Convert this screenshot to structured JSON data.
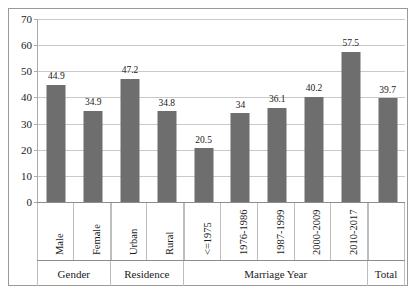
{
  "chart_data": {
    "type": "bar",
    "title": "",
    "subtitle": "",
    "xlabel": "",
    "ylabel": "",
    "ylim": [
      0,
      70
    ],
    "ytick_step": 10,
    "yticks": [
      0,
      10,
      20,
      30,
      40,
      50,
      60,
      70
    ],
    "ytick_labels": [
      "0",
      "10",
      "20",
      "30",
      "40",
      "50",
      "60",
      "70"
    ],
    "grid": true,
    "legend": false,
    "legend_position": "none",
    "bar_color": "#6e6e6e",
    "gridline_color": "#c9c9c9",
    "axis_color": "#8d8d8d",
    "categories": [
      "Male",
      "Female",
      "Urban",
      "Rural",
      "<=1975",
      "1976-1986",
      "1987-1999",
      "2000-2009",
      "2010-2017",
      ""
    ],
    "values": [
      44.9,
      34.9,
      47.2,
      34.8,
      20.5,
      34,
      36.1,
      40.2,
      57.5,
      39.7
    ],
    "data_labels": [
      "44.9",
      "34.9",
      "47.2",
      "34.8",
      "20.5",
      "34",
      "36.1",
      "40.2",
      "57.5",
      "39.7"
    ],
    "groups": [
      {
        "label": "Gender",
        "start": 0,
        "count": 2
      },
      {
        "label": "Residence",
        "start": 2,
        "count": 2
      },
      {
        "label": "Marriage Year",
        "start": 4,
        "count": 5
      },
      {
        "label": "Total",
        "start": 9,
        "count": 1
      }
    ]
  }
}
